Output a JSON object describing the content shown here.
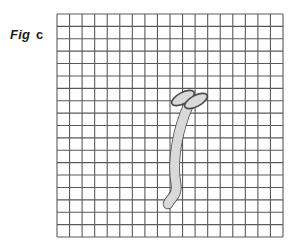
{
  "figure": {
    "label": {
      "word": "Fig",
      "letter": "c"
    },
    "caption_full": "Fig c",
    "background_color": "#ffffff"
  },
  "grid": {
    "x": 57,
    "y": 14,
    "width": 226,
    "height": 223,
    "columns": 18,
    "rows": 18,
    "cell_width": 12.55,
    "cell_height": 12.39,
    "line_color": "#5a5a5a",
    "line_width": 1.1
  },
  "bone": {
    "name": "clavicle-bone",
    "fill_color": "#d9d9d9",
    "outline_color": "#4a4a4a",
    "outline_width": 1.6,
    "shaft": {
      "top_x": 189,
      "top_y": 104,
      "bottom_x": 168,
      "bottom_y": 204,
      "thickness": 9
    },
    "heads": [
      {
        "name": "head-upper-left",
        "cx": 183,
        "cy": 98,
        "rx": 12.5,
        "ry": 5.5,
        "angle": -28
      },
      {
        "name": "head-upper-right",
        "cx": 196,
        "cy": 101,
        "rx": 12.5,
        "ry": 5.5,
        "angle": -28
      }
    ]
  }
}
